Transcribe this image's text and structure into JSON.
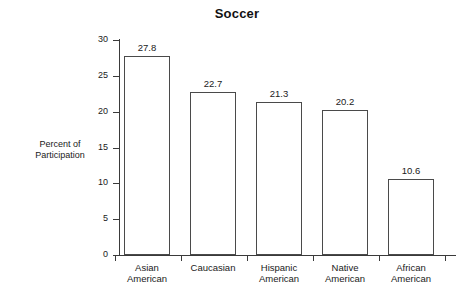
{
  "chart_data": {
    "type": "bar",
    "title": "Soccer",
    "xlabel": "",
    "ylabel": "Percent of Participation",
    "ylabel_lines": [
      "Percent of",
      "Participation"
    ],
    "categories": [
      "Asian American",
      "Caucasian",
      "Hispanic American",
      "Native American",
      "African American"
    ],
    "category_lines": [
      [
        "Asian",
        "American"
      ],
      [
        "Caucasian"
      ],
      [
        "Hispanic",
        "American"
      ],
      [
        "Native",
        "American"
      ],
      [
        "African",
        "American"
      ]
    ],
    "values": [
      27.8,
      22.7,
      21.3,
      20.2,
      10.6
    ],
    "value_labels": [
      "27.8",
      "22.7",
      "21.3",
      "20.2",
      "10.6"
    ],
    "ylim": [
      0,
      30
    ],
    "yticks": [
      0,
      5,
      10,
      15,
      20,
      25,
      30
    ],
    "ytick_labels": [
      "0",
      "5",
      "10",
      "15",
      "20",
      "25",
      "30"
    ],
    "grid": false,
    "legend": false,
    "bar_fill": "#ffffff",
    "bar_stroke": "#4a4a4a",
    "axis_color": "#3a3a3a",
    "text_color": "#1a1a1a",
    "background": "#ffffff"
  }
}
